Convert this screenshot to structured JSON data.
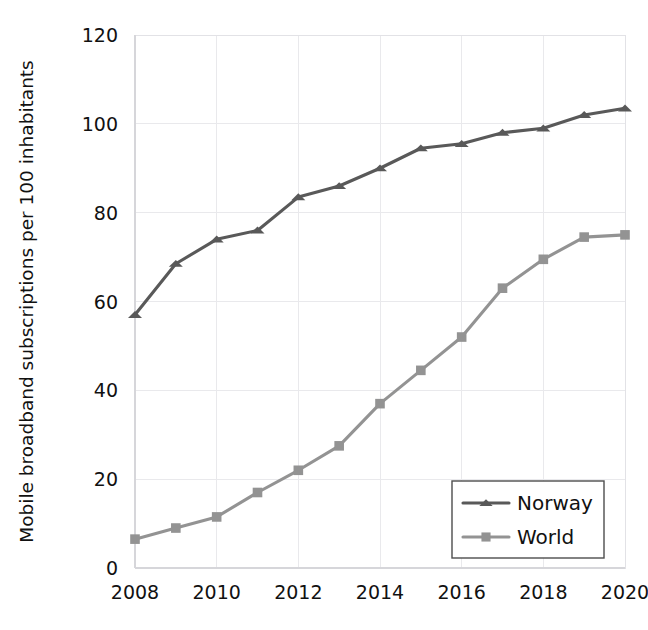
{
  "chart_data": {
    "type": "line",
    "title": "",
    "subtitle": "",
    "xlabel": "",
    "ylabel": "Mobile broadband subscriptions per 100 inhabitants",
    "x": [
      2008,
      2009,
      2010,
      2011,
      2012,
      2013,
      2014,
      2015,
      2016,
      2017,
      2018,
      2019,
      2020
    ],
    "categories": [
      "2008",
      "2009",
      "2010",
      "2011",
      "2012",
      "2013",
      "2014",
      "2015",
      "2016",
      "2017",
      "2018",
      "2019",
      "2020"
    ],
    "xlim": [
      2008,
      2020
    ],
    "ylim": [
      0,
      120
    ],
    "x_tick_labels": [
      "2008",
      "2010",
      "2012",
      "2014",
      "2016",
      "2018",
      "2020"
    ],
    "x_tick_values": [
      2008,
      2010,
      2012,
      2014,
      2016,
      2018,
      2020
    ],
    "y_tick_labels": [
      "0",
      "20",
      "40",
      "60",
      "80",
      "100",
      "120"
    ],
    "y_tick_values": [
      0,
      20,
      40,
      60,
      80,
      100,
      120
    ],
    "grid": true,
    "legend_position": "lower-right",
    "series": [
      {
        "name": "Norway",
        "color": "#595959",
        "marker": "triangle",
        "values": [
          57,
          68.5,
          74,
          76,
          83.5,
          86,
          90,
          94.5,
          95.5,
          98,
          99,
          102,
          103.5
        ]
      },
      {
        "name": "World",
        "color": "#939393",
        "marker": "square",
        "values": [
          6.5,
          9,
          11.5,
          17,
          22,
          27.5,
          37,
          44.5,
          52,
          63,
          69.5,
          74.5,
          75
        ]
      }
    ]
  },
  "legend": {
    "entries": [
      {
        "label": "Norway"
      },
      {
        "label": "World"
      }
    ]
  },
  "colors": {
    "norway": "#595959",
    "world": "#939393",
    "gridline": "#e9e9ec",
    "axis": "#d6d6da",
    "text": "#111111"
  }
}
